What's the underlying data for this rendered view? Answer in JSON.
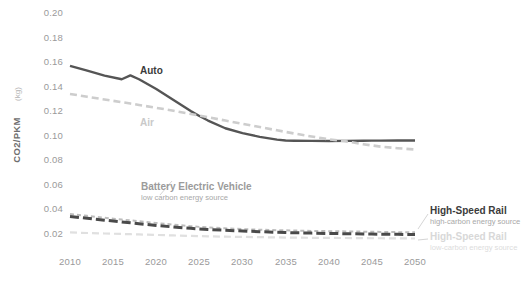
{
  "figure": {
    "name": "co2-per-pkm-by-mode",
    "background_color": "#ffffff"
  },
  "axes": {
    "y_label_main": "CO2/PKM",
    "y_label_unit": "(kg)",
    "y_ticks": [
      "0.20",
      "0.18",
      "0.16",
      "0.14",
      "0.12",
      "0.10",
      "0.08",
      "0.06",
      "0.04",
      "0.02"
    ],
    "x_ticks": [
      "2010",
      "2015",
      "2020",
      "2025",
      "2030",
      "2035",
      "2040",
      "2045",
      "2050"
    ],
    "tick_color": "#9a9a9a",
    "grid": false
  },
  "annotations": {
    "auto": {
      "title": "Auto",
      "subtitle": "",
      "color": "#3b3b3b"
    },
    "air": {
      "title": "Air",
      "subtitle": "",
      "color": "#c9c9c9"
    },
    "bev": {
      "title": "Battery Electric Vehicle",
      "subtitle": "low carbon energy source",
      "color": "#9b9b9b"
    },
    "hsr_high": {
      "title": "High-Speed Rail",
      "subtitle": "high-carbon energy source",
      "color": "#3b3b3b"
    },
    "hsr_low": {
      "title": "High-Speed Rail",
      "subtitle": "low-carbon energy source",
      "color": "#d8d8d8"
    }
  },
  "chart_data": {
    "type": "line",
    "title": "",
    "xlabel": "",
    "ylabel": "CO2/PKM (kg)",
    "xlim": [
      2010,
      2050
    ],
    "ylim": [
      0.0,
      0.2
    ],
    "yticks": [
      0.02,
      0.04,
      0.06,
      0.08,
      0.1,
      0.12,
      0.14,
      0.16,
      0.18,
      0.2
    ],
    "xticks": [
      2010,
      2015,
      2020,
      2025,
      2030,
      2035,
      2040,
      2045,
      2050
    ],
    "grid": false,
    "legend_position": "inline-annotations",
    "x": [
      2010,
      2012,
      2014,
      2016,
      2017,
      2018,
      2020,
      2022,
      2024,
      2025,
      2026,
      2028,
      2030,
      2032,
      2034,
      2035,
      2036,
      2038,
      2040,
      2042,
      2044,
      2045,
      2046,
      2048,
      2050
    ],
    "series": [
      {
        "name": "Auto",
        "color": "#555555",
        "style": "solid",
        "width": 2.4,
        "values": [
          0.1565,
          0.1525,
          0.1485,
          0.1455,
          0.1487,
          0.1455,
          0.1375,
          0.1285,
          0.1195,
          0.1155,
          0.1118,
          0.1055,
          0.1015,
          0.0985,
          0.0962,
          0.0955,
          0.0953,
          0.0952,
          0.0951,
          0.0952,
          0.0953,
          0.0954,
          0.0954,
          0.0955,
          0.0955
        ]
      },
      {
        "name": "Air",
        "color": "#cdcdcd",
        "style": "dashed",
        "width": 2.6,
        "values": [
          0.1335,
          0.1312,
          0.129,
          0.1268,
          0.1257,
          0.1245,
          0.1222,
          0.1198,
          0.1172,
          0.1158,
          0.1145,
          0.1118,
          0.1092,
          0.1065,
          0.1038,
          0.1025,
          0.1012,
          0.0988,
          0.0965,
          0.0948,
          0.0925,
          0.0915,
          0.0905,
          0.0892,
          0.0882
        ]
      },
      {
        "name": "Battery Electric Vehicle",
        "sublabel": "low carbon energy source",
        "color": "#bdbdbd",
        "style": "dashed-fine",
        "width": 2.0,
        "values": [
          0.0355,
          0.034,
          0.0325,
          0.031,
          0.0303,
          0.0296,
          0.0282,
          0.0268,
          0.0256,
          0.025,
          0.0246,
          0.0238,
          0.0232,
          0.0227,
          0.0223,
          0.0222,
          0.022,
          0.0217,
          0.0215,
          0.0213,
          0.0211,
          0.021,
          0.0209,
          0.0207,
          0.0206
        ]
      },
      {
        "name": "High-Speed Rail (high-carbon)",
        "sublabel": "high-carbon energy source",
        "color": "#4a4a4a",
        "style": "dashed-thick",
        "width": 3.0,
        "values": [
          0.0335,
          0.032,
          0.0305,
          0.029,
          0.0283,
          0.0276,
          0.0262,
          0.0249,
          0.0238,
          0.0233,
          0.0229,
          0.0222,
          0.0216,
          0.0211,
          0.0206,
          0.0204,
          0.0202,
          0.0199,
          0.0196,
          0.0194,
          0.0192,
          0.0191,
          0.019,
          0.0189,
          0.0188
        ]
      },
      {
        "name": "High-Speed Rail (low-carbon)",
        "sublabel": "low-carbon energy source",
        "color": "#e0e0e0",
        "style": "dashed",
        "width": 2.2,
        "values": [
          0.0205,
          0.02,
          0.0196,
          0.0192,
          0.019,
          0.0188,
          0.0184,
          0.018,
          0.0176,
          0.0175,
          0.0173,
          0.017,
          0.0168,
          0.0166,
          0.0164,
          0.0163,
          0.0162,
          0.0161,
          0.016,
          0.0159,
          0.0158,
          0.0157,
          0.0157,
          0.0156,
          0.0155
        ]
      }
    ]
  }
}
